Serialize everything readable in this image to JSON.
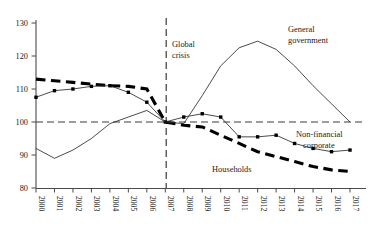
{
  "chart_data": {
    "type": "line",
    "title": "",
    "subtitle": "",
    "xlabel": "",
    "ylabel": "",
    "xlim": [
      2000,
      2017
    ],
    "ylim": [
      80,
      130
    ],
    "ytick_values": [
      80,
      90,
      100,
      110,
      120,
      130
    ],
    "ytick_labels": [
      "80",
      "90",
      "100",
      "110",
      "120",
      "130"
    ],
    "grid": false,
    "legend_position": "inline-annotations",
    "x": [
      2000,
      2001,
      2002,
      2003,
      2004,
      2005,
      2006,
      2007,
      2008,
      2009,
      2010,
      2011,
      2012,
      2013,
      2014,
      2015,
      2016,
      2017
    ],
    "xtick_labels": [
      "2000",
      "2001",
      "2002",
      "2003",
      "2004",
      "2005",
      "2006",
      "2007",
      "2008",
      "2009",
      "2010",
      "2011",
      "2012",
      "2013",
      "2014",
      "2015",
      "2016",
      "2017"
    ],
    "series": [
      {
        "name": "Households",
        "style": "thick-dashed",
        "markers": false,
        "color": "#000000",
        "values": [
          113.0,
          112.5,
          112.0,
          111.5,
          111.0,
          110.8,
          110.0,
          100.0,
          99.0,
          98.5,
          96.0,
          93.5,
          91.0,
          89.5,
          88.0,
          86.5,
          85.5,
          85.0
        ]
      },
      {
        "name": "Non-financial corporate",
        "style": "thin-solid",
        "markers": true,
        "marker_shape": "square",
        "color": "#2a2a2a",
        "values": [
          107.5,
          109.5,
          110.0,
          110.8,
          111.0,
          109.0,
          106.0,
          100.0,
          101.5,
          102.5,
          101.5,
          95.5,
          95.5,
          96.0,
          93.5,
          92.0,
          91.0,
          91.5
        ]
      },
      {
        "name": "General government",
        "style": "thin-solid",
        "markers": false,
        "color": "#2a2a2a",
        "values": [
          92.0,
          89.0,
          91.5,
          95.0,
          99.5,
          101.5,
          103.5,
          100.0,
          99.5,
          108.0,
          117.0,
          122.5,
          124.5,
          122.0,
          117.0,
          111.0,
          105.5,
          100.0
        ]
      }
    ],
    "annotations": [
      {
        "id": "global-crisis",
        "text_line1": "Global",
        "text_line2": "crisis",
        "at_x": 2007
      },
      {
        "id": "general-government",
        "text_line1": "General",
        "text_line2": "government"
      },
      {
        "id": "non-financial-corporate",
        "text_line1": "Non-financial",
        "text_line2": "corporate"
      },
      {
        "id": "households",
        "text_line1": "Households",
        "text_line2": ""
      }
    ],
    "reference_line": {
      "value": 100,
      "style": "dashed"
    }
  }
}
